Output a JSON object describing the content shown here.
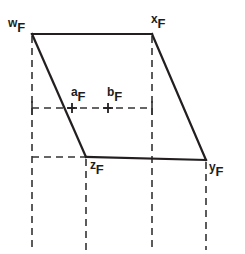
{
  "figure": {
    "type": "line-diagram",
    "width": 245,
    "height": 254,
    "background_color": "#ffffff",
    "stroke_color": "#231f20",
    "dash_color": "#333333",
    "solid_stroke_width": 2.2,
    "dashed_stroke_width": 1.6,
    "dash_pattern": "7,5",
    "vertices": [
      {
        "id": "w",
        "label_base": "w",
        "label_sub": "F",
        "x": 32,
        "y": 34,
        "label_x": 10,
        "label_y": 18
      },
      {
        "id": "x",
        "label_base": "x",
        "label_sub": "F",
        "x": 152,
        "y": 34,
        "label_x": 152,
        "label_y": 14
      },
      {
        "id": "y",
        "label_base": "y",
        "label_sub": "F",
        "x": 206,
        "y": 160,
        "label_x": 210,
        "label_y": 163
      },
      {
        "id": "z",
        "label_base": "z",
        "label_sub": "F",
        "x": 86,
        "y": 157,
        "label_x": 90,
        "label_y": 161
      }
    ],
    "solid_edges": [
      {
        "name": "edge-w-x",
        "x1": 32,
        "y1": 34,
        "x2": 152,
        "y2": 34
      },
      {
        "name": "edge-x-y",
        "x1": 152,
        "y1": 34,
        "x2": 206,
        "y2": 160
      },
      {
        "name": "edge-y-z",
        "x1": 206,
        "y1": 160,
        "x2": 86,
        "y2": 157
      },
      {
        "name": "edge-z-w",
        "x1": 86,
        "y1": 157,
        "x2": 32,
        "y2": 34
      }
    ],
    "dashed_vertical_lines": [
      {
        "name": "dashed-vertical-w",
        "x": 32,
        "y1": 36,
        "y2": 250
      },
      {
        "name": "dashed-vertical-z",
        "x": 86,
        "y1": 159,
        "y2": 250
      },
      {
        "name": "dashed-vertical-x",
        "x": 152,
        "y1": 36,
        "y2": 250
      },
      {
        "name": "dashed-vertical-y",
        "x": 206,
        "y1": 162,
        "y2": 250
      }
    ],
    "dashed_horizontal_lines": [
      {
        "name": "dashed-horizontal-mid",
        "y": 108,
        "x1": 32,
        "x2": 152
      },
      {
        "name": "dashed-horizontal-bottom",
        "y": 157,
        "x1": 32,
        "x2": 86
      }
    ],
    "tick_marks": [
      {
        "name": "tick-left-mid",
        "x": 32,
        "y": 108,
        "half": 7
      },
      {
        "name": "tick-right-mid",
        "x": 152,
        "y": 108,
        "half": 7
      }
    ],
    "marker_points": [
      {
        "id": "a",
        "label_base": "a",
        "label_sub": "F",
        "x": 72,
        "y": 108,
        "label_x": 72,
        "label_y": 88,
        "size": 5
      },
      {
        "id": "b",
        "label_base": "b",
        "label_sub": "F",
        "x": 108,
        "y": 108,
        "label_x": 108,
        "label_y": 88,
        "size": 5
      }
    ]
  }
}
